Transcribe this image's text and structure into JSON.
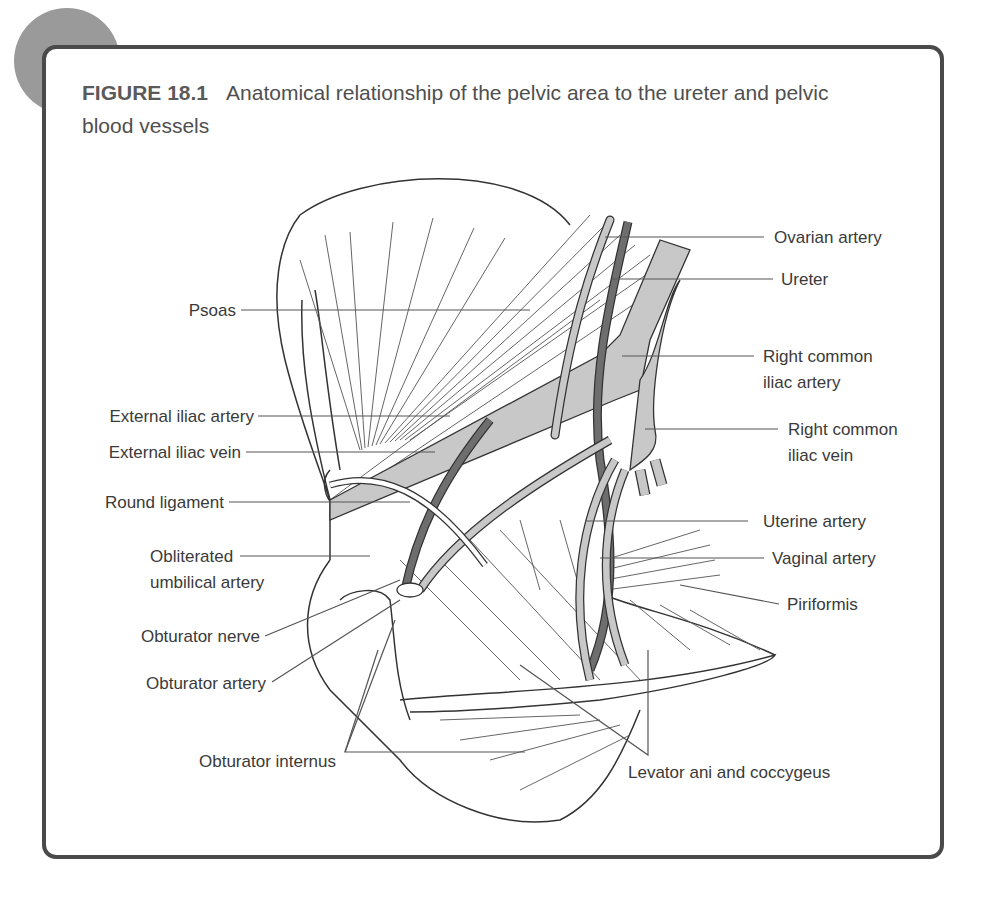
{
  "figure": {
    "label": "FIGURE 18.1",
    "title": "Anatomical relationship of the pelvic area to the ureter and pelvic blood vessels"
  },
  "colors": {
    "frame": "#4a4a4a",
    "corner_circle": "#9a9a9a",
    "vessel_light": "#c8c8c8",
    "vessel_dark": "#6e6e6e",
    "text": "#3a3a3a"
  },
  "labels": {
    "left": [
      {
        "id": "psoas",
        "text": "Psoas"
      },
      {
        "id": "external-iliac-artery",
        "text": "External iliac artery"
      },
      {
        "id": "external-iliac-vein",
        "text": "External iliac vein"
      },
      {
        "id": "round-ligament",
        "text": "Round ligament"
      },
      {
        "id": "obliterated-umbilical-artery",
        "line1": "Obliterated",
        "line2": "umbilical artery"
      },
      {
        "id": "obturator-nerve",
        "text": "Obturator nerve"
      },
      {
        "id": "obturator-artery",
        "text": "Obturator artery"
      },
      {
        "id": "obturator-internus",
        "text": "Obturator internus"
      }
    ],
    "right": [
      {
        "id": "ovarian-artery",
        "text": "Ovarian artery"
      },
      {
        "id": "ureter",
        "text": "Ureter"
      },
      {
        "id": "right-common-iliac-artery",
        "line1": "Right common",
        "line2": "iliac artery"
      },
      {
        "id": "right-common-iliac-vein",
        "line1": "Right common",
        "line2": "iliac vein"
      },
      {
        "id": "uterine-artery",
        "text": "Uterine artery"
      },
      {
        "id": "vaginal-artery",
        "text": "Vaginal artery"
      },
      {
        "id": "piriformis",
        "text": "Piriformis"
      },
      {
        "id": "levator-ani-and-coccygeus",
        "text": "Levator ani and coccygeus"
      }
    ]
  }
}
